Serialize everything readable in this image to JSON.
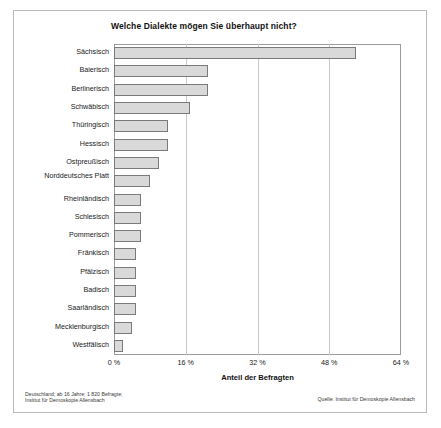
{
  "figure": {
    "title": "Welche Dialekte mögen Sie überhaupt nicht?",
    "x_axis_label": "Anteil der Befragten",
    "footer_left_line1": "Deutschland; ab 16 Jahre; 1 820 Befragte;",
    "footer_left_line2": "Institut für Demoskopie Allensbach",
    "footer_right": "Quelle: Institut für Demoskopie Allensbach",
    "bar_fill_color": "#d9d9d9",
    "bar_border_color": "#7a7a7a",
    "grid_color": "#c9c9c9",
    "frame_color": "#9b9b9b"
  },
  "chart_data": {
    "type": "bar",
    "orientation": "horizontal",
    "title": "Welche Dialekte mögen Sie überhaupt nicht?",
    "subtitle": "",
    "xlabel": "Anteil der Befragten",
    "ylabel": "",
    "xlim": [
      0,
      64
    ],
    "grid": true,
    "legend": false,
    "tick_labels": [
      "0 %",
      "16 %",
      "32 %",
      "48 %",
      "64 %"
    ],
    "ticks": [
      0,
      16,
      32,
      48,
      64
    ],
    "categories": [
      "Sächsisch",
      "Baierisch",
      "Berlinerisch",
      "Schwäbisch",
      "Thüringisch",
      "Hessisch",
      "Ostpreußisch",
      "Norddeutsches Platt",
      "Rheinländisch",
      "Schlesisch",
      "Pommerisch",
      "Fränkisch",
      "Pfälzisch",
      "Badisch",
      "Saarländisch",
      "Mecklenburgisch",
      "Westfälisch"
    ],
    "values": [
      54,
      21,
      21,
      17,
      12,
      12,
      10,
      8,
      6,
      6,
      6,
      5,
      5,
      5,
      5,
      4,
      2
    ]
  }
}
